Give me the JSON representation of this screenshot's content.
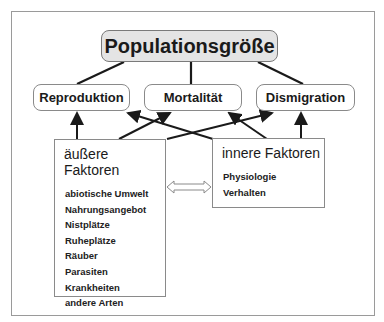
{
  "diagram": {
    "title": "Populationsgröße",
    "outcomes": [
      {
        "label": "Reproduktion"
      },
      {
        "label": "Mortalität"
      },
      {
        "label": "Dismigration"
      }
    ],
    "external_factors": {
      "heading": "äußere Faktoren",
      "items": [
        "abiotische Umwelt",
        "Nahrungsangebot",
        "Nistplätze",
        "Ruheplätze",
        "Räuber",
        "Parasiten",
        "Krankheiten",
        "andere Arten"
      ]
    },
    "internal_factors": {
      "heading": "innere Faktoren",
      "items": [
        "Physiologie",
        "Verhalten"
      ]
    },
    "connections": [
      {
        "from": "Reproduktion",
        "to": "Populationsgröße"
      },
      {
        "from": "Mortalität",
        "to": "Populationsgröße"
      },
      {
        "from": "Dismigration",
        "to": "Populationsgröße"
      },
      {
        "from": "äußere Faktoren",
        "to": "Reproduktion"
      },
      {
        "from": "äußere Faktoren",
        "to": "Mortalität"
      },
      {
        "from": "äußere Faktoren",
        "to": "Dismigration"
      },
      {
        "from": "innere Faktoren",
        "to": "Reproduktion"
      },
      {
        "from": "innere Faktoren",
        "to": "Mortalität"
      },
      {
        "from": "innere Faktoren",
        "to": "Dismigration"
      },
      {
        "from": "äußere Faktoren",
        "to": "innere Faktoren",
        "bidirectional": true
      }
    ],
    "colors": {
      "title_fill": "#e4e4e4",
      "border": "#8a8a8a",
      "line": "#1a1a1a"
    }
  }
}
